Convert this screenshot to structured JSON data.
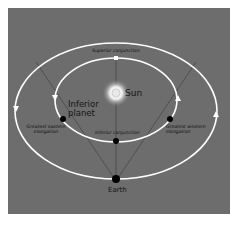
{
  "diagram": {
    "background_color": "#6d6d6d",
    "orbit_color": "#ffffff",
    "labels": {
      "superior_conjunction": "Superior conjunction",
      "sun": "Sun",
      "inferior_planet": "Inferior planet",
      "greatest_eastern_elongation": "Greatest eastern elongation",
      "greatest_western_elongation": "Greatest western elongation",
      "inferior_conjunction": "Inferior conjunction",
      "earth": "Earth"
    },
    "nodes": [
      {
        "id": "sun",
        "label": "Sun",
        "type": "star"
      },
      {
        "id": "earth",
        "label": "Earth",
        "type": "planet"
      },
      {
        "id": "superior_conjunction",
        "label": "Superior conjunction",
        "type": "position"
      },
      {
        "id": "inferior_conjunction",
        "label": "Inferior conjunction",
        "type": "position"
      },
      {
        "id": "greatest_eastern_elongation",
        "label": "Greatest eastern elongation",
        "type": "position"
      },
      {
        "id": "greatest_western_elongation",
        "label": "Greatest western elongation",
        "type": "position"
      }
    ],
    "edges": [
      {
        "from": "earth",
        "to": "superior_conjunction",
        "type": "line-of-sight"
      },
      {
        "from": "earth",
        "to": "greatest_eastern_elongation",
        "type": "tangent-line"
      },
      {
        "from": "earth",
        "to": "greatest_western_elongation",
        "type": "tangent-line"
      }
    ],
    "orbits": [
      {
        "name": "inner-orbit",
        "body": "Inferior planet",
        "direction": "counterclockwise"
      },
      {
        "name": "outer-orbit",
        "body": "Earth",
        "direction": "counterclockwise"
      }
    ]
  }
}
